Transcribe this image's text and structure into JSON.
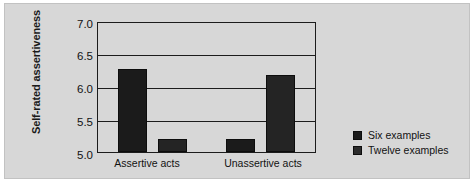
{
  "chart_data": {
    "type": "bar",
    "title": "",
    "xlabel": "",
    "ylabel": "Self-rated assertiveness",
    "categories": [
      "Assertive acts",
      "Unassertive acts"
    ],
    "series": [
      {
        "name": "Six examples",
        "values": [
          6.3,
          5.2
        ],
        "color": "#1b1b1b"
      },
      {
        "name": "Twelve examples",
        "values": [
          5.2,
          6.2
        ],
        "color": "#242424"
      }
    ],
    "ylim": [
      5.0,
      7.0
    ],
    "yticks": [
      "7.0",
      "6.5",
      "6.0",
      "5.5",
      "5.0"
    ],
    "ytick_values": [
      7.0,
      6.5,
      6.0,
      5.5,
      5.0
    ],
    "grid": "horizontal",
    "legend_position": "right",
    "background_color": "#d7d7d7",
    "axis_color": "#1c1c1c"
  }
}
